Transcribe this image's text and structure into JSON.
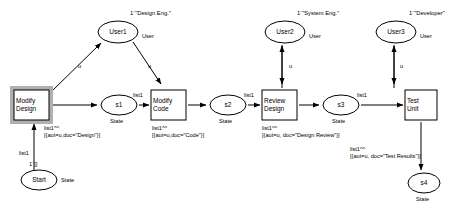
{
  "diagram": {
    "kind": "coloured-petri-net",
    "stroke_color": "#000000",
    "fill_color": "#ffffff",
    "shadow_color": "#b0b0b0"
  },
  "places": [
    {
      "id": "user1",
      "name": "User1",
      "colour_set": "User",
      "marking": "1`\"Design Eng.\"",
      "shape": "ellipse",
      "cx": 118,
      "cy": 32,
      "rx": 20,
      "ry": 11
    },
    {
      "id": "user2",
      "name": "User2",
      "colour_set": "User",
      "marking": "1`\"System Eng.\"",
      "shape": "ellipse",
      "cx": 285,
      "cy": 32,
      "rx": 20,
      "ry": 11
    },
    {
      "id": "user3",
      "name": "User3",
      "colour_set": "User",
      "marking": "1`\"Developer\"",
      "shape": "ellipse",
      "cx": 396,
      "cy": 32,
      "rx": 20,
      "ry": 11
    },
    {
      "id": "start",
      "name": "Start",
      "colour_set": "State",
      "marking": "1`[]",
      "shape": "ellipse",
      "cx": 39,
      "cy": 180,
      "rx": 18,
      "ry": 10
    },
    {
      "id": "s1",
      "name": "s1",
      "colour_set": "State",
      "marking": "",
      "shape": "ellipse",
      "cx": 119,
      "cy": 105,
      "rx": 18,
      "ry": 10
    },
    {
      "id": "s2",
      "name": "s2",
      "colour_set": "State",
      "marking": "",
      "shape": "ellipse",
      "cx": 228,
      "cy": 105,
      "rx": 18,
      "ry": 10
    },
    {
      "id": "s3",
      "name": "s3",
      "colour_set": "State",
      "marking": "",
      "shape": "ellipse",
      "cx": 341,
      "cy": 105,
      "rx": 18,
      "ry": 10
    },
    {
      "id": "s4",
      "name": "s4",
      "colour_set": "State",
      "marking": "",
      "shape": "ellipse",
      "cx": 424,
      "cy": 183,
      "rx": 16,
      "ry": 10
    }
  ],
  "transitions": [
    {
      "id": "modify_design",
      "line1": "Modify",
      "line2": "Design",
      "enabled": true,
      "x": 14,
      "y": 90,
      "w": 35,
      "h": 30
    },
    {
      "id": "modify_code",
      "line1": "Modify",
      "line2": "Code",
      "enabled": false,
      "x": 151,
      "y": 90,
      "w": 35,
      "h": 30
    },
    {
      "id": "review_design",
      "line1": "Review",
      "line2": "Design",
      "enabled": false,
      "x": 262,
      "y": 90,
      "w": 35,
      "h": 30
    },
    {
      "id": "test_unit",
      "line1": "Test",
      "line2": "Unit",
      "enabled": false,
      "x": 405,
      "y": 90,
      "w": 32,
      "h": 30
    }
  ],
  "arc_labels": [
    {
      "id": "a_md_u1",
      "text": "u",
      "x": 78,
      "y": 63
    },
    {
      "id": "a_u1_mc",
      "text": "u",
      "x": 148,
      "y": 63
    },
    {
      "id": "a_u2_rd",
      "text": "u",
      "x": 289,
      "y": 63
    },
    {
      "id": "a_u3_tu",
      "text": "u",
      "x": 400,
      "y": 63
    },
    {
      "id": "a_start_md",
      "text": "list1",
      "x": 19,
      "y": 150
    },
    {
      "id": "a_s1_mc",
      "text": "list1",
      "x": 133,
      "y": 92
    },
    {
      "id": "a_s2_rd",
      "text": "list1",
      "x": 244,
      "y": 92
    },
    {
      "id": "a_s3_tu",
      "text": "list1",
      "x": 357,
      "y": 92
    }
  ],
  "arc_expressions": [
    {
      "id": "e_design",
      "head": "list1^^",
      "body": "[{aut=u,doc=\"Design\"}]",
      "x": 44,
      "y": 125
    },
    {
      "id": "e_code",
      "head": "list1^^",
      "body": "[{aut=u,doc=\"Code\"}]",
      "x": 152,
      "y": 125
    },
    {
      "id": "e_designreview",
      "head": "list1^^",
      "body": "[{aut=u, doc=\"Design Review\"}]",
      "x": 262,
      "y": 125
    },
    {
      "id": "e_testresults",
      "head": "list1^^",
      "body": "[{aut=u, doc=\"Test Results\"}]",
      "x": 350,
      "y": 146
    }
  ],
  "colour_set_labels": [
    {
      "id": "cs_user1",
      "text": "User",
      "x": 142,
      "y": 33
    },
    {
      "id": "cs_user2",
      "text": "User",
      "x": 309,
      "y": 33
    },
    {
      "id": "cs_user3",
      "text": "User",
      "x": 420,
      "y": 33
    },
    {
      "id": "cs_start",
      "text": "State",
      "x": 61,
      "y": 177
    },
    {
      "id": "cs_s1",
      "text": "State",
      "x": 110,
      "y": 118
    },
    {
      "id": "cs_s2",
      "text": "State",
      "x": 219,
      "y": 118
    },
    {
      "id": "cs_s3",
      "text": "State",
      "x": 332,
      "y": 118
    },
    {
      "id": "cs_s4",
      "text": "State",
      "x": 416,
      "y": 196
    }
  ],
  "markings": [
    {
      "id": "m_user1",
      "text": "1`\"Design Eng.\"",
      "x": 130,
      "y": 10
    },
    {
      "id": "m_user2",
      "text": "1`\"System Eng.\"",
      "x": 297,
      "y": 10
    },
    {
      "id": "m_user3",
      "text": "1`\"Developer\"",
      "x": 409,
      "y": 10
    },
    {
      "id": "m_start",
      "text": "1`[]",
      "x": 29,
      "y": 161
    }
  ]
}
